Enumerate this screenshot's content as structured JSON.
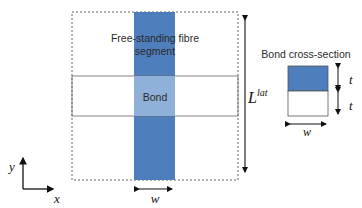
{
  "diagram": {
    "fibre_label_line1": "Free-standing fibre",
    "fibre_label_line2": "segment",
    "bond_label": "Bond",
    "length_symbol": "L",
    "length_superscript": "lat",
    "width_symbol": "w",
    "axis_x": "x",
    "axis_y": "y"
  },
  "cross_section": {
    "title": "Bond cross-section",
    "thickness_top": "t",
    "thickness_bottom": "t",
    "width_symbol": "w"
  },
  "colors": {
    "fibre": "#4f7ebd",
    "bond_overlap": "#8fb0d9",
    "outline": "#555555",
    "text": "#2a2a2a"
  }
}
